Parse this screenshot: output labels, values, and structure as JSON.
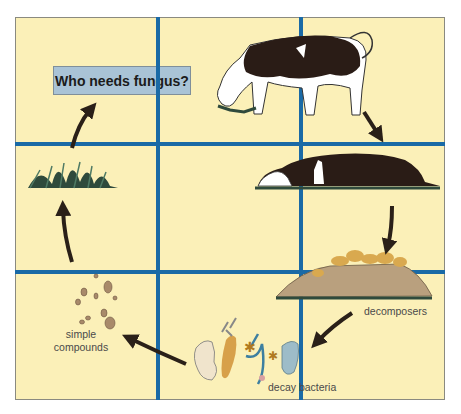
{
  "title": "Who needs fungus?",
  "colors": {
    "background": "#fbf0b8",
    "grid_lines": "#1a6aa6",
    "title_box": "#a9c3d6",
    "arrows": "#2a2018",
    "grass": "#2f4a3c",
    "mushrooms": "#d9a94f",
    "soil": "#b9a07e"
  },
  "stages": [
    {
      "id": "grass",
      "label": ""
    },
    {
      "id": "cow-grazing",
      "label": ""
    },
    {
      "id": "dead-cow",
      "label": ""
    },
    {
      "id": "decomposers",
      "label": "decomposers"
    },
    {
      "id": "decay-bacteria",
      "label": "decay bacteria"
    },
    {
      "id": "simple-compounds",
      "label": "simple compounds",
      "label_lines": [
        "simple",
        "compounds"
      ]
    }
  ],
  "cycle_order": [
    "grass",
    "cow-grazing",
    "dead-cow",
    "decomposers",
    "decay-bacteria",
    "simple-compounds",
    "grass"
  ]
}
